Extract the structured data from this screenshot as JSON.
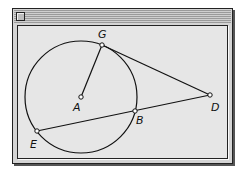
{
  "window": {
    "close_box": "close-box-icon"
  },
  "diagram": {
    "circle": {
      "center": "A",
      "cx": 81,
      "cy": 97,
      "r": 56
    },
    "points": {
      "G": {
        "x": 102,
        "y": 45,
        "label": "G",
        "lx": 98,
        "ly": 38
      },
      "A": {
        "x": 81,
        "y": 97,
        "label": "A",
        "lx": 73,
        "ly": 111
      },
      "D": {
        "x": 210,
        "y": 95,
        "label": "D",
        "lx": 211,
        "ly": 111
      },
      "B": {
        "x": 135,
        "y": 111,
        "label": "B",
        "lx": 136,
        "ly": 124
      },
      "E": {
        "x": 37,
        "y": 131,
        "label": "E",
        "lx": 30,
        "ly": 148
      }
    },
    "segments": [
      [
        "A",
        "G"
      ],
      [
        "G",
        "D"
      ],
      [
        "E",
        "D"
      ]
    ],
    "labels": {
      "G": "G",
      "A": "A",
      "D": "D",
      "B": "B",
      "E": "E"
    },
    "colors": {
      "stroke": "#111111",
      "point_fill": "#ffffff",
      "background": "#e6e6e6"
    }
  }
}
